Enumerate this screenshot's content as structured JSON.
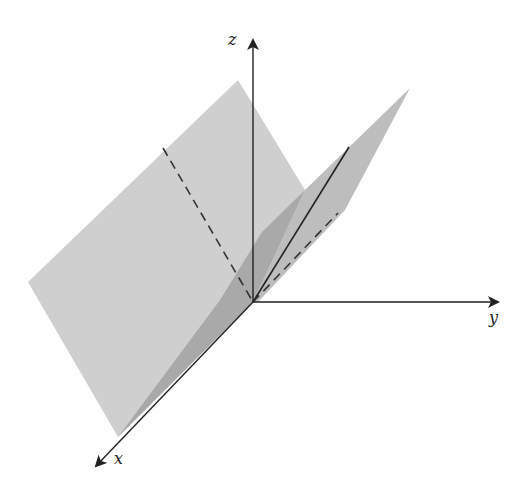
{
  "diagram": {
    "type": "3d-coordinate-surface",
    "origin": [
      253,
      302
    ],
    "axes": {
      "z": {
        "label": "z",
        "end": [
          253,
          40
        ],
        "label_pos": [
          228,
          32
        ]
      },
      "y": {
        "label": "y",
        "end": [
          498,
          302
        ],
        "label_pos": [
          489,
          310
        ]
      },
      "x": {
        "label": "x",
        "end": [
          96,
          466
        ],
        "label_pos": [
          114,
          451
        ]
      }
    },
    "colors": {
      "background": "#ffffff",
      "plane_light": "#cfcfcf",
      "plane_mid": "#bdbdbd",
      "plane_dark": "#a9a9a9",
      "axis": "#222222",
      "dash": "#333333"
    },
    "surfaces": {
      "left_plane": [
        [
          28,
          282
        ],
        [
          238,
          80
        ],
        [
          305,
          190
        ],
        [
          253,
          302
        ],
        [
          118,
          437
        ]
      ],
      "right_plane": [
        [
          253,
          302
        ],
        [
          305,
          190
        ],
        [
          410,
          88
        ],
        [
          345,
          210
        ],
        [
          258,
          302
        ]
      ],
      "dark_wedge": [
        [
          118,
          437
        ],
        [
          253,
          302
        ],
        [
          305,
          190
        ],
        [
          262,
          232
        ],
        [
          220,
          300
        ]
      ]
    },
    "lines": {
      "solid_diag": [
        [
          253,
          302
        ],
        [
          349,
          147
        ]
      ],
      "dash_left": [
        [
          163,
          148
        ],
        [
          253,
          302
        ]
      ],
      "dash_right": [
        [
          253,
          302
        ],
        [
          338,
          213
        ]
      ]
    }
  }
}
